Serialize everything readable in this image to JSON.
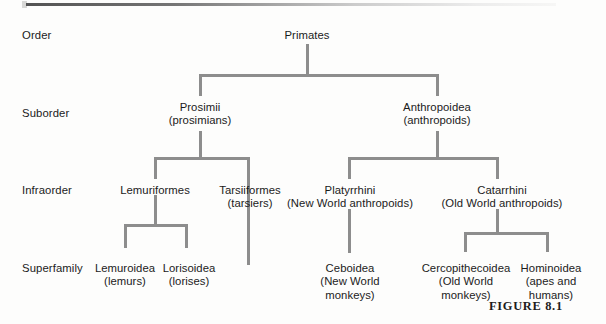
{
  "figure": {
    "caption": "FIGURE 8.1"
  },
  "ranks": [
    {
      "label": "Order",
      "x": 22,
      "y": 29
    },
    {
      "label": "Suborder",
      "x": 22,
      "y": 107
    },
    {
      "label": "Infraorder",
      "x": 22,
      "y": 184
    },
    {
      "label": "Superfamily",
      "x": 22,
      "y": 262
    }
  ],
  "nodes": [
    {
      "name": "primates",
      "lines": [
        "Primates"
      ],
      "x": 307,
      "y": 29
    },
    {
      "name": "prosimii",
      "lines": [
        "Prosimii",
        "(prosimians)"
      ],
      "x": 200,
      "y": 101
    },
    {
      "name": "anthropoidea",
      "lines": [
        "Anthropoidea",
        "(anthropoids)"
      ],
      "x": 437,
      "y": 101
    },
    {
      "name": "lemuriformes",
      "lines": [
        "Lemuriformes"
      ],
      "x": 155,
      "y": 184
    },
    {
      "name": "tarsiiformes",
      "lines": [
        "Tarsiiformes",
        "(tarsiers)"
      ],
      "x": 250,
      "y": 184
    },
    {
      "name": "platyrrhini",
      "lines": [
        "Platyrrhini",
        "(New World anthropoids)"
      ],
      "x": 350,
      "y": 184
    },
    {
      "name": "catarrhini",
      "lines": [
        "Catarrhini",
        "(Old World anthropoids)"
      ],
      "x": 502,
      "y": 184
    },
    {
      "name": "lemuroidea",
      "lines": [
        "Lemuroidea",
        "(lemurs)"
      ],
      "x": 125,
      "y": 262
    },
    {
      "name": "lorisoidea",
      "lines": [
        "Lorisoidea",
        "(lorises)"
      ],
      "x": 189,
      "y": 262
    },
    {
      "name": "ceboidea",
      "lines": [
        "Ceboidea",
        "(New World",
        "monkeys)"
      ],
      "x": 350,
      "y": 262
    },
    {
      "name": "cercopithecoidea",
      "lines": [
        "Cercopithecoidea",
        "(Old World",
        "monkeys)"
      ],
      "x": 466,
      "y": 262
    },
    {
      "name": "hominoidea",
      "lines": [
        "Hominoidea",
        "(apes and",
        "humans)"
      ],
      "x": 551,
      "y": 262
    }
  ],
  "connectors": {
    "color": "#8d8d8d",
    "segments": [
      {
        "name": "primates-stem",
        "type": "v",
        "x": 306,
        "y": 44,
        "len": 30
      },
      {
        "name": "order-crossbar",
        "type": "h",
        "x": 199,
        "y": 74,
        "len": 240
      },
      {
        "name": "prosimii-drop",
        "type": "v",
        "x": 199,
        "y": 74,
        "len": 22
      },
      {
        "name": "anthropoidea-drop",
        "type": "v",
        "x": 436,
        "y": 74,
        "len": 22
      },
      {
        "name": "prosimii-stem",
        "type": "v",
        "x": 199,
        "y": 131,
        "len": 26
      },
      {
        "name": "prosimii-crossbar",
        "type": "h",
        "x": 154,
        "y": 157,
        "len": 96
      },
      {
        "name": "lemuriformes-drop",
        "type": "v",
        "x": 154,
        "y": 157,
        "len": 22
      },
      {
        "name": "tarsiiformes-drop",
        "type": "v",
        "x": 247,
        "y": 157,
        "len": 108
      },
      {
        "name": "anthropoidea-stem",
        "type": "v",
        "x": 436,
        "y": 131,
        "len": 26
      },
      {
        "name": "anthropoidea-crossbar",
        "type": "h",
        "x": 348,
        "y": 157,
        "len": 151
      },
      {
        "name": "platyrrhini-drop",
        "type": "v",
        "x": 348,
        "y": 157,
        "len": 22
      },
      {
        "name": "catarrhini-drop",
        "type": "v",
        "x": 496,
        "y": 157,
        "len": 22
      },
      {
        "name": "lemuriformes-stem",
        "type": "v",
        "x": 154,
        "y": 195,
        "len": 29
      },
      {
        "name": "lemuriformes-crossbar",
        "type": "h",
        "x": 124,
        "y": 224,
        "len": 64
      },
      {
        "name": "lemuroidea-drop",
        "type": "v",
        "x": 124,
        "y": 224,
        "len": 24
      },
      {
        "name": "lorisoidea-drop",
        "type": "v",
        "x": 185,
        "y": 224,
        "len": 24
      },
      {
        "name": "platyrrhini-to-ceboidea",
        "type": "v",
        "x": 348,
        "y": 209,
        "len": 44
      },
      {
        "name": "catarrhini-stem",
        "type": "v",
        "x": 496,
        "y": 209,
        "len": 23
      },
      {
        "name": "catarrhini-crossbar",
        "type": "h",
        "x": 464,
        "y": 232,
        "len": 85
      },
      {
        "name": "cercopithecoidea-drop",
        "type": "v",
        "x": 464,
        "y": 232,
        "len": 20
      },
      {
        "name": "hominoidea-drop",
        "type": "v",
        "x": 546,
        "y": 232,
        "len": 20
      }
    ]
  }
}
